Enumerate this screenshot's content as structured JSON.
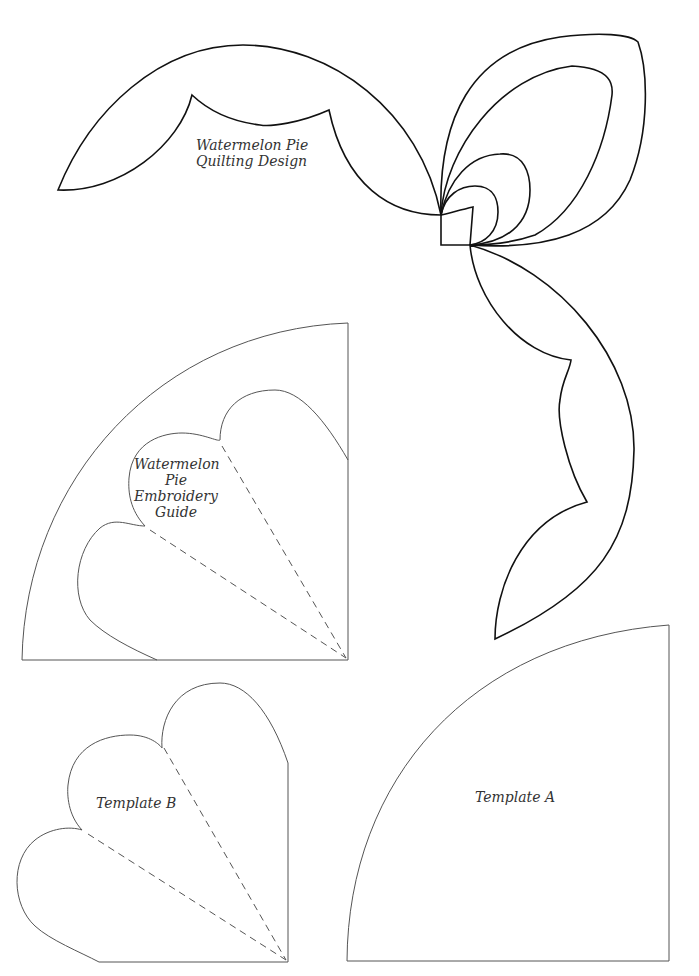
{
  "page": {
    "title": "Watermelon Pie Quilting Design",
    "background": "#ffffff",
    "line_color_bold": "#111111",
    "line_color_thin": "#555555"
  },
  "quilting_design": {
    "label_line1": "Watermelon Pie",
    "label_line2": "Quilting Design"
  },
  "embroidery_guide": {
    "label_line1": "Watermelon",
    "label_line2": "Pie",
    "label_line3": "Embroidery",
    "label_line4": "Guide"
  },
  "template_b": {
    "label": "Template B"
  },
  "template_a": {
    "label": "Template A"
  }
}
